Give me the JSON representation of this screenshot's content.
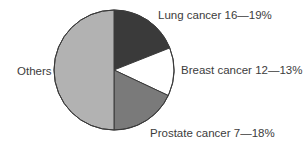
{
  "chart_data": {
    "type": "pie",
    "title": "",
    "unit": "%",
    "start_angle_deg": -90,
    "direction": "clockwise",
    "slices": [
      {
        "name": "Lung cancer",
        "label": "Lung cancer 16—19%",
        "rank": "16",
        "value": 19,
        "color": "#3a3a3a"
      },
      {
        "name": "Breast cancer",
        "label": "Breast cancer 12—13%",
        "rank": "12",
        "value": 13,
        "color": "#ffffff"
      },
      {
        "name": "Prostate cancer",
        "label": "Prostate cancer 7—18%",
        "rank": "7",
        "value": 18,
        "color": "#7a7a7a"
      },
      {
        "name": "Others",
        "label": "Others",
        "rank": null,
        "value": 50,
        "color": "#b2b2b2"
      }
    ],
    "legend": "none (direct slice labels)",
    "outline_color": "#3a3a3a"
  },
  "labels": {
    "lung": "Lung cancer 16—19%",
    "breast": "Breast cancer 12—13%",
    "prostate": "Prostate cancer 7—18%",
    "others": "Others"
  }
}
